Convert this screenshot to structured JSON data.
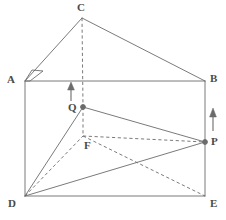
{
  "figure": {
    "canvas": {
      "width": 226,
      "height": 220
    },
    "stroke_color": "#6b6b6b",
    "label_color": "#4a4a4a",
    "background_color": "#ffffff"
  },
  "labels": {
    "A": "A",
    "B": "B",
    "C": "C",
    "D": "D",
    "E": "E",
    "F": "F",
    "P": "P",
    "Q": "Q"
  },
  "points": {
    "A": {
      "x": 25,
      "y": 81
    },
    "B": {
      "x": 205,
      "y": 81
    },
    "C": {
      "x": 82,
      "y": 18
    },
    "D": {
      "x": 25,
      "y": 196
    },
    "E": {
      "x": 205,
      "y": 196
    },
    "F": {
      "x": 83,
      "y": 136
    },
    "P": {
      "x": 205,
      "y": 142
    },
    "Q": {
      "x": 83,
      "y": 107
    }
  },
  "label_positions": {
    "A": {
      "x": 7,
      "y": 74
    },
    "B": {
      "x": 210,
      "y": 73
    },
    "C": {
      "x": 77,
      "y": 2
    },
    "D": {
      "x": 8,
      "y": 198
    },
    "E": {
      "x": 210,
      "y": 198
    },
    "F": {
      "x": 84,
      "y": 140
    },
    "P": {
      "x": 211,
      "y": 136
    },
    "Q": {
      "x": 68,
      "y": 102
    }
  },
  "solid_edges": [
    {
      "name": "edge-A-B",
      "from": "A",
      "to": "B"
    },
    {
      "name": "edge-A-D",
      "from": "A",
      "to": "D"
    },
    {
      "name": "edge-B-E",
      "from": "B",
      "to": "E"
    },
    {
      "name": "edge-D-E",
      "from": "D",
      "to": "E"
    },
    {
      "name": "edge-A-C",
      "from": "A",
      "to": "C"
    },
    {
      "name": "edge-C-B",
      "from": "C",
      "to": "B"
    },
    {
      "name": "edge-D-Q",
      "from": "D",
      "to": "Q"
    },
    {
      "name": "edge-Q-P",
      "from": "Q",
      "to": "P"
    },
    {
      "name": "edge-D-P",
      "from": "D",
      "to": "P"
    }
  ],
  "dashed_edges": [
    {
      "name": "edge-C-Q",
      "from": "C",
      "to": "Q"
    },
    {
      "name": "edge-Q-F",
      "from": "Q",
      "to": "F"
    },
    {
      "name": "edge-D-F",
      "from": "D",
      "to": "F"
    },
    {
      "name": "edge-F-P",
      "from": "F",
      "to": "P"
    },
    {
      "name": "edge-F-E",
      "from": "F",
      "to": "E"
    }
  ],
  "dots": [
    {
      "name": "point-marker-Q",
      "at": "Q"
    },
    {
      "name": "point-marker-P",
      "at": "P"
    }
  ],
  "arrows": [
    {
      "name": "arrow-left",
      "x": 71,
      "y_tail": 101,
      "y_head": 84
    },
    {
      "name": "arrow-right",
      "x": 213,
      "y_tail": 131,
      "y_head": 110
    }
  ],
  "right_angle_mark": {
    "name": "right-angle-mark-at-A",
    "points": "25,81 32,70 43,71 30,81"
  }
}
